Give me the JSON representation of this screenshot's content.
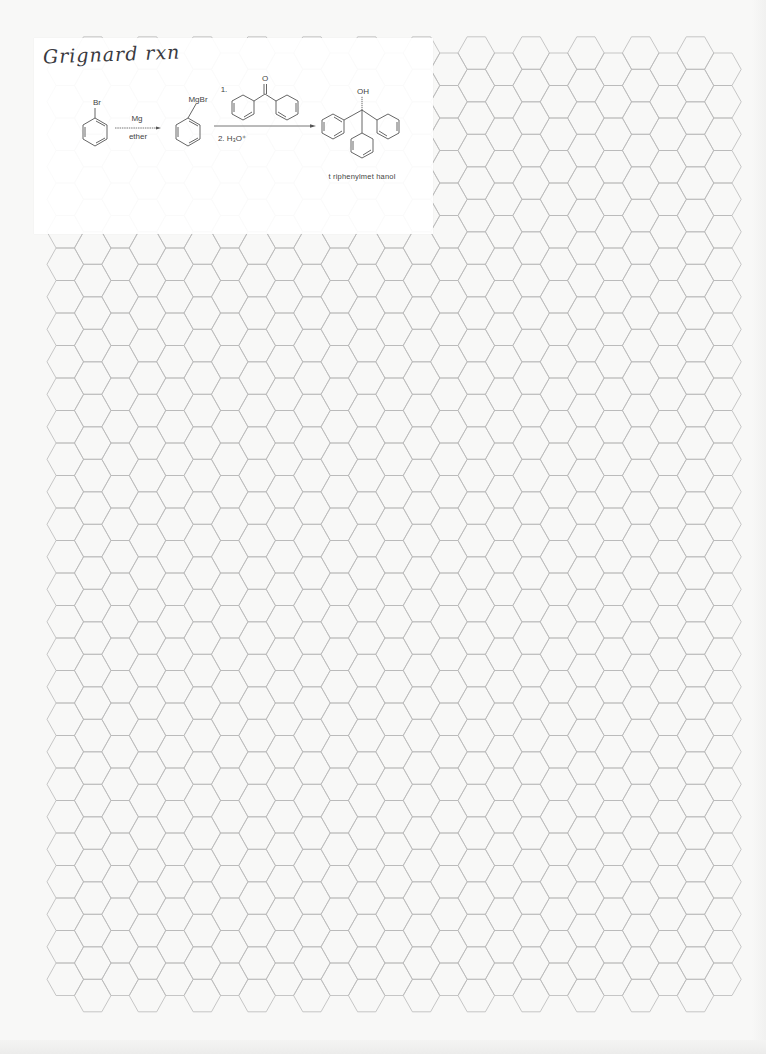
{
  "page": {
    "background": "#f8f8f7",
    "grid_line_color": "#b9b9b9"
  },
  "hex_grid": {
    "orientation": "flat-top",
    "columns": 25,
    "origin_x": 47,
    "half_width": 18.3,
    "column_step": 27.4,
    "row_height": 32.5,
    "even_column_first_top": 53,
    "even_column_rows": 29,
    "odd_column_first_top": 36.75,
    "odd_column_rows": 30
  },
  "card": {
    "title_handwritten": "Grignard rxn",
    "reaction": {
      "starting_material": {
        "name": "bromobenzene",
        "substituent_label": "Br"
      },
      "step1": {
        "reagent_above": "Mg",
        "reagent_below": "ether"
      },
      "intermediate": {
        "name": "phenylmagnesium bromide",
        "substituent_label": "MgBr"
      },
      "step2": {
        "reagent_1_label": "1.",
        "reagent_1": "benzophenone",
        "carbonyl_label": "O",
        "reagent_2_label": "2. H₃O⁺"
      },
      "product": {
        "name_label": "t riphenylmet hanol",
        "substituent_label": "OH"
      }
    }
  }
}
